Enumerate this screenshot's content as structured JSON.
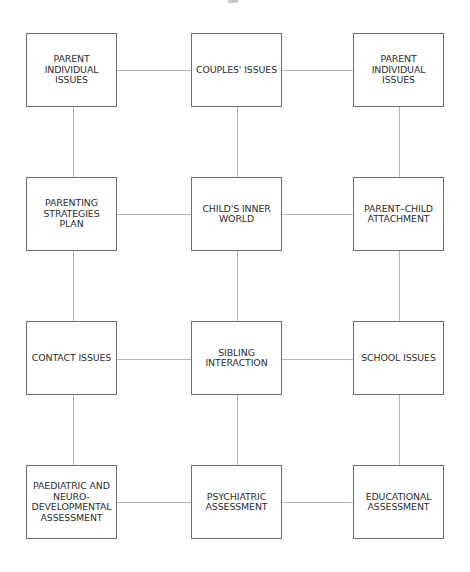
{
  "diagram": {
    "type": "grid-network",
    "rows": 4,
    "cols": 3,
    "nodes": [
      {
        "id": "parent-individual-issues-left",
        "label": "PARENT\nINDIVIDUAL\nISSUES",
        "row": 0,
        "col": 0
      },
      {
        "id": "couples-issues",
        "label": "COUPLES' ISSUES",
        "row": 0,
        "col": 1
      },
      {
        "id": "parent-individual-issues-right",
        "label": "PARENT\nINDIVIDUAL\nISSUES",
        "row": 0,
        "col": 2
      },
      {
        "id": "parenting-strategies-plan",
        "label": "PARENTING\nSTRATEGIES\nPLAN",
        "row": 1,
        "col": 0
      },
      {
        "id": "childs-inner-world",
        "label": "CHILD'S INNER\nWORLD",
        "row": 1,
        "col": 1
      },
      {
        "id": "parent-child-attachment",
        "label": "PARENT–CHILD\nATTACHMENT",
        "row": 1,
        "col": 2
      },
      {
        "id": "contact-issues",
        "label": "CONTACT ISSUES",
        "row": 2,
        "col": 0
      },
      {
        "id": "sibling-interaction",
        "label": "SIBLING\nINTERACTION",
        "row": 2,
        "col": 1
      },
      {
        "id": "school-issues",
        "label": "SCHOOL ISSUES",
        "row": 2,
        "col": 2
      },
      {
        "id": "paediatric-neurodevelopmental-assessment",
        "label": "PAEDIATRIC AND\nNEURO-\nDEVELOPMENTAL\nASSESSMENT",
        "row": 3,
        "col": 0
      },
      {
        "id": "psychiatric-assessment",
        "label": "PSYCHIATRIC\nASSESSMENT",
        "row": 3,
        "col": 1
      },
      {
        "id": "educational-assessment",
        "label": "EDUCATIONAL\nASSESSMENT",
        "row": 3,
        "col": 2
      }
    ],
    "edges": "all horizontally and vertically adjacent nodes connected",
    "colors": {
      "box_border": "#6e6e6e",
      "connector": "#b4b4b4",
      "text": "#2e2e2e",
      "background": "#ffffff"
    }
  }
}
